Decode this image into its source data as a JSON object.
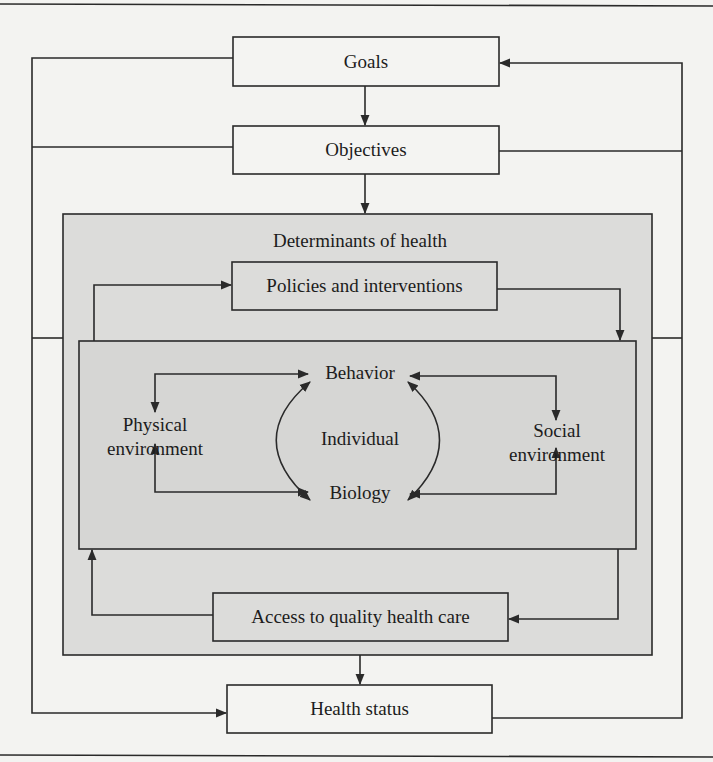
{
  "diagram": {
    "type": "flow",
    "colors": {
      "background": "#f3f3f1",
      "panel_fill": "#dcdcda",
      "inner_fill": "#d6d6d4",
      "box_fill": "#f4f4f2",
      "stroke": "#2a2a2a"
    },
    "nodes": {
      "goals": "Goals",
      "objectives": "Objectives",
      "determinants_title": "Determinants of health",
      "policies": "Policies and interventions",
      "behavior": "Behavior",
      "biology": "Biology",
      "individual": "Individual",
      "physical_line1": "Physical",
      "physical_line2": "environment",
      "social_line1": "Social",
      "social_line2": "environment",
      "access": "Access to quality health care",
      "health_status": "Health status"
    },
    "edges": [
      {
        "from": "Goals",
        "to": "Objectives"
      },
      {
        "from": "Objectives",
        "to": "Determinants of health"
      },
      {
        "from": "Determinants of health",
        "to": "Health status"
      },
      {
        "from": "Health status",
        "to": "Goals",
        "route": "right feedback loop"
      },
      {
        "from": "Goals",
        "to": "Health status",
        "route": "left loop"
      },
      {
        "from": "Objectives",
        "to": "left loop"
      },
      {
        "from": "Objectives",
        "to": "right loop"
      },
      {
        "from": "Policies and interventions",
        "to": "Individual block"
      },
      {
        "from": "Individual block",
        "to": "Policies and interventions"
      },
      {
        "from": "Individual block",
        "to": "Access to quality health care"
      },
      {
        "from": "Access to quality health care",
        "to": "Individual block"
      },
      {
        "from": "Physical environment",
        "to": "Behavior",
        "bidirectional": true
      },
      {
        "from": "Physical environment",
        "to": "Biology",
        "bidirectional": true
      },
      {
        "from": "Social environment",
        "to": "Behavior",
        "bidirectional": true
      },
      {
        "from": "Social environment",
        "to": "Biology",
        "bidirectional": true
      },
      {
        "from": "Behavior",
        "to": "Biology",
        "bidirectional": true
      }
    ]
  }
}
